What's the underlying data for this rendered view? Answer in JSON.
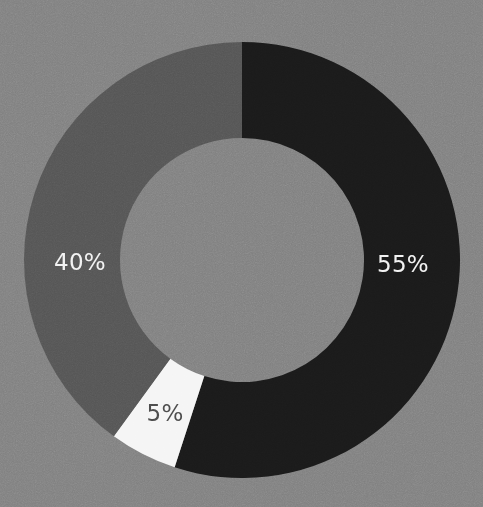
{
  "chart_data": {
    "type": "pie",
    "variant": "donut",
    "title": "",
    "subtitle": "",
    "xlabel": "",
    "ylabel": "",
    "legend": null,
    "legend_position": "none",
    "grid": false,
    "labels_shown": true,
    "label_format": "percent",
    "start_angle_deg": 0,
    "direction": "clockwise",
    "hole_ratio": 0.56,
    "categories": [
      "55%",
      "5%",
      "40%"
    ],
    "values": [
      55,
      5,
      40
    ],
    "slices": [
      {
        "label": "55%",
        "value": 55,
        "color": "#1a1a1a",
        "label_color": "#f2f2f2",
        "start_angle_deg": 0,
        "end_angle_deg": 198,
        "label_x": 403,
        "label_y": 264
      },
      {
        "label": "5%",
        "value": 5,
        "color": "#f5f5f5",
        "label_color": "#4a4a4a",
        "start_angle_deg": 198,
        "end_angle_deg": 216,
        "label_x": 165,
        "label_y": 413
      },
      {
        "label": "40%",
        "value": 40,
        "color": "#555555",
        "label_color": "#f2f2f2",
        "start_angle_deg": 216,
        "end_angle_deg": 360,
        "label_x": 80,
        "label_y": 262
      }
    ],
    "background_color": "#808080",
    "center_x": 242,
    "center_y": 260,
    "outer_radius": 218,
    "inner_radius": 122
  }
}
